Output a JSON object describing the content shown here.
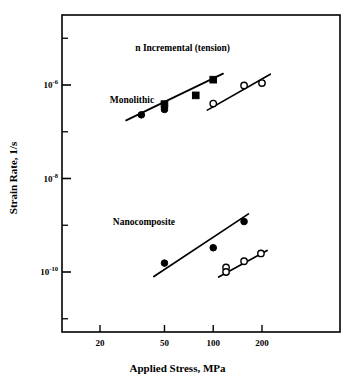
{
  "chart_data": {
    "type": "scatter",
    "title": "",
    "xlabel": "Applied Stress, MPa",
    "ylabel": "Strain Rate, 1/s",
    "xscale": "log",
    "yscale": "log",
    "xlim": [
      15,
      330
    ],
    "ylim": [
      3e-12,
      3e-05
    ],
    "grid": false,
    "legend": "none",
    "xticks": [
      20,
      50,
      100,
      200
    ],
    "xtick_labels": [
      "20",
      "50",
      "100",
      "200"
    ],
    "yticks": [
      1e-06,
      1e-08,
      1e-10
    ],
    "ytick_labels": [
      "10-6",
      "10-8",
      "10-10"
    ],
    "ytick_mantissa": "10",
    "ytick_exponents": [
      "-6",
      "-8",
      "-10"
    ],
    "yminor_ticks": [
      1e-05,
      1e-07,
      1e-09,
      1e-11
    ],
    "annotations": [
      {
        "text": "n Incremental (tension)",
        "x": 33,
        "y": 6e-06
      },
      {
        "text": "Monolithic",
        "x": 23,
        "y": 4.5e-07
      },
      {
        "text": "Nanocomposite",
        "x": 24,
        "y": 1.1e-09
      }
    ],
    "series": [
      {
        "name": "Monolithic filled",
        "marker": "filled",
        "color": "#000000",
        "points": [
          {
            "x": 36,
            "y": 2.3e-07,
            "marker": "circle"
          },
          {
            "x": 50,
            "y": 3.9e-07,
            "marker": "square"
          },
          {
            "x": 50,
            "y": 3e-07,
            "marker": "circle"
          },
          {
            "x": 78,
            "y": 6e-07,
            "marker": "square"
          },
          {
            "x": 100,
            "y": 1.3e-06,
            "marker": "square"
          }
        ],
        "fit_line": {
          "x1": 29,
          "y1": 1.75e-07,
          "x2": 115,
          "y2": 1.75e-06
        }
      },
      {
        "name": "Monolithic open",
        "marker": "open-circle",
        "color": "#000000",
        "points": [
          {
            "x": 100,
            "y": 4e-07,
            "marker": "circle"
          },
          {
            "x": 155,
            "y": 9.8e-07,
            "marker": "circle"
          },
          {
            "x": 200,
            "y": 1.1e-06,
            "marker": "circle"
          }
        ],
        "fit_line": {
          "x1": 92,
          "y1": 2.9e-07,
          "x2": 225,
          "y2": 1.7e-06
        }
      },
      {
        "name": "Nanocomposite filled",
        "marker": "filled-circle",
        "color": "#000000",
        "points": [
          {
            "x": 50,
            "y": 1.55e-10,
            "marker": "circle"
          },
          {
            "x": 100,
            "y": 3.3e-10,
            "marker": "circle"
          },
          {
            "x": 155,
            "y": 1.2e-09,
            "marker": "circle"
          }
        ],
        "fit_line": {
          "x1": 43,
          "y1": 8e-11,
          "x2": 165,
          "y2": 1.75e-09
        }
      },
      {
        "name": "Nanocomposite open",
        "marker": "open-circle",
        "color": "#000000",
        "points": [
          {
            "x": 120,
            "y": 1.25e-10,
            "marker": "circle"
          },
          {
            "x": 120,
            "y": 1e-10,
            "marker": "circle"
          },
          {
            "x": 155,
            "y": 1.7e-10,
            "marker": "circle"
          },
          {
            "x": 197,
            "y": 2.5e-10,
            "marker": "circle"
          }
        ],
        "fit_line": {
          "x1": 108,
          "y1": 7.8e-11,
          "x2": 215,
          "y2": 2.9e-10
        }
      }
    ]
  }
}
